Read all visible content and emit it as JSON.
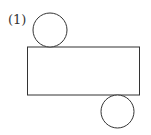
{
  "diagram": {
    "label": "(1)",
    "stroke_color": "#333333",
    "fill_color": "#ffffff",
    "shapes": {
      "top_circle": {
        "cx": 50,
        "cy": 30,
        "r": 17
      },
      "rectangle": {
        "x": 27.5,
        "y": 47,
        "width": 112,
        "height": 48
      },
      "bottom_circle": {
        "cx": 117.5,
        "cy": 111.5,
        "r": 16.5
      }
    }
  }
}
